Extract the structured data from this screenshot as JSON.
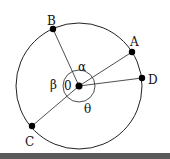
{
  "diagram": {
    "type": "circle-with-radii",
    "center": {
      "label": "0",
      "x": 79,
      "y": 86
    },
    "radius": 63,
    "inner_arc_radius": 16,
    "points": [
      {
        "id": "B",
        "label": "B",
        "x": 53,
        "y": 29,
        "lx": 47,
        "ly": 25
      },
      {
        "id": "A",
        "label": "A",
        "x": 132,
        "y": 52,
        "lx": 130,
        "ly": 46
      },
      {
        "id": "D",
        "label": "D",
        "x": 142,
        "y": 78,
        "lx": 149,
        "ly": 84
      },
      {
        "id": "C",
        "label": "C",
        "x": 32,
        "y": 126,
        "lx": 26,
        "ly": 145
      }
    ],
    "angles": [
      {
        "symbol": "α",
        "x": 78,
        "y": 70
      },
      {
        "symbol": "β",
        "x": 50,
        "y": 89
      },
      {
        "symbol": "θ",
        "x": 84,
        "y": 112
      }
    ],
    "colors": {
      "stroke": "#222222",
      "point": "#000000",
      "background": "#ffffff"
    }
  }
}
